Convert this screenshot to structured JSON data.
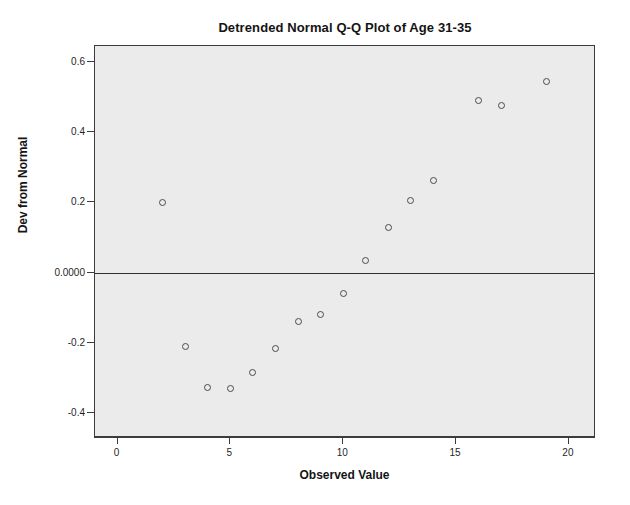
{
  "chart_data": {
    "type": "scatter",
    "title": "Detrended Normal Q-Q Plot of Age 31-35",
    "xlabel": "Observed Value",
    "ylabel": "Dev from Normal",
    "xlim": [
      -1,
      21.2
    ],
    "ylim": [
      -0.47,
      0.645
    ],
    "grid": false,
    "legend": null,
    "xticks": [
      0,
      5,
      10,
      15,
      20
    ],
    "xtick_labels": [
      "0",
      "5",
      "10",
      "15",
      "20"
    ],
    "yticks": [
      0.6,
      0.4,
      0.2,
      0.0,
      -0.2,
      -0.4
    ],
    "ytick_labels": [
      "0.6",
      "0.4",
      "0.2",
      "0.0000",
      "-0.2",
      "-0.4"
    ],
    "reference_line": {
      "y": 0.0,
      "orientation": "horizontal"
    },
    "marker": "open-circle",
    "marker_color": "#4a4a4a",
    "plot_background": "#ebebeb",
    "x": [
      2,
      3,
      4,
      5,
      6,
      7,
      8,
      9,
      10,
      11,
      12,
      13,
      14,
      16,
      17,
      19
    ],
    "y": [
      0.2,
      -0.21,
      -0.325,
      -0.33,
      -0.285,
      -0.215,
      -0.14,
      -0.12,
      -0.06,
      0.035,
      0.13,
      0.205,
      0.262,
      0.49,
      0.475,
      0.545
    ],
    "points": [
      {
        "x": 2,
        "y": 0.2
      },
      {
        "x": 3,
        "y": -0.21
      },
      {
        "x": 4,
        "y": -0.325
      },
      {
        "x": 5,
        "y": -0.33
      },
      {
        "x": 6,
        "y": -0.285
      },
      {
        "x": 7,
        "y": -0.215
      },
      {
        "x": 8,
        "y": -0.14
      },
      {
        "x": 9,
        "y": -0.12
      },
      {
        "x": 10,
        "y": -0.06
      },
      {
        "x": 11,
        "y": 0.035
      },
      {
        "x": 12,
        "y": 0.13
      },
      {
        "x": 13,
        "y": 0.205
      },
      {
        "x": 14,
        "y": 0.262
      },
      {
        "x": 16,
        "y": 0.49
      },
      {
        "x": 17,
        "y": 0.475
      },
      {
        "x": 19,
        "y": 0.545
      }
    ]
  }
}
